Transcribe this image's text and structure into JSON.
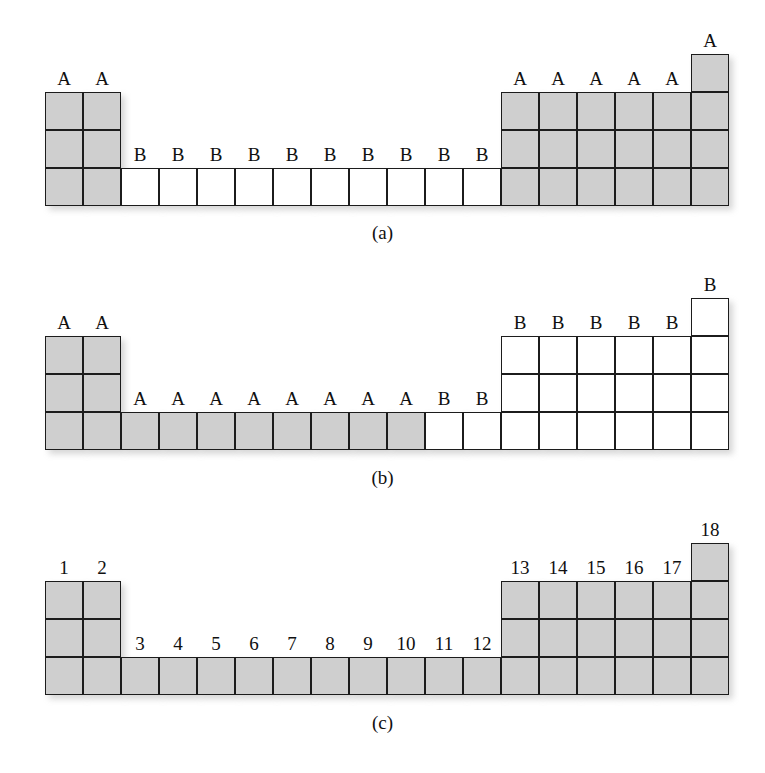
{
  "figure": {
    "colors": {
      "shaded_cell": "#cfcfcf",
      "empty_cell": "#ffffff",
      "cell_border": "#1c1c1c",
      "text": "#101010",
      "background": "#ffffff"
    },
    "geometry": {
      "columns": 18,
      "cell_size": 38,
      "grid_left": 45
    }
  },
  "panels": [
    {
      "id": "panel-a",
      "caption": "(a)",
      "caption_y": 222,
      "grid_top": 54,
      "columns": [
        {
          "index": 1,
          "label": "A",
          "shaded": true,
          "rows": 3,
          "row_offset": 1
        },
        {
          "index": 2,
          "label": "A",
          "shaded": true,
          "rows": 3,
          "row_offset": 1
        },
        {
          "index": 3,
          "label": "B",
          "shaded": false,
          "rows": 1,
          "row_offset": 3
        },
        {
          "index": 4,
          "label": "B",
          "shaded": false,
          "rows": 1,
          "row_offset": 3
        },
        {
          "index": 5,
          "label": "B",
          "shaded": false,
          "rows": 1,
          "row_offset": 3
        },
        {
          "index": 6,
          "label": "B",
          "shaded": false,
          "rows": 1,
          "row_offset": 3
        },
        {
          "index": 7,
          "label": "B",
          "shaded": false,
          "rows": 1,
          "row_offset": 3
        },
        {
          "index": 8,
          "label": "B",
          "shaded": false,
          "rows": 1,
          "row_offset": 3
        },
        {
          "index": 9,
          "label": "B",
          "shaded": false,
          "rows": 1,
          "row_offset": 3
        },
        {
          "index": 10,
          "label": "B",
          "shaded": false,
          "rows": 1,
          "row_offset": 3
        },
        {
          "index": 11,
          "label": "B",
          "shaded": false,
          "rows": 1,
          "row_offset": 3
        },
        {
          "index": 12,
          "label": "B",
          "shaded": false,
          "rows": 1,
          "row_offset": 3
        },
        {
          "index": 13,
          "label": "A",
          "shaded": true,
          "rows": 3,
          "row_offset": 1
        },
        {
          "index": 14,
          "label": "A",
          "shaded": true,
          "rows": 3,
          "row_offset": 1
        },
        {
          "index": 15,
          "label": "A",
          "shaded": true,
          "rows": 3,
          "row_offset": 1
        },
        {
          "index": 16,
          "label": "A",
          "shaded": true,
          "rows": 3,
          "row_offset": 1
        },
        {
          "index": 17,
          "label": "A",
          "shaded": true,
          "rows": 3,
          "row_offset": 1
        },
        {
          "index": 18,
          "label": "A",
          "shaded": true,
          "rows": 4,
          "row_offset": 0
        }
      ]
    },
    {
      "id": "panel-b",
      "caption": "(b)",
      "caption_y": 467,
      "grid_top": 298,
      "columns": [
        {
          "index": 1,
          "label": "A",
          "shaded": true,
          "rows": 3,
          "row_offset": 1
        },
        {
          "index": 2,
          "label": "A",
          "shaded": true,
          "rows": 3,
          "row_offset": 1
        },
        {
          "index": 3,
          "label": "A",
          "shaded": true,
          "rows": 1,
          "row_offset": 3
        },
        {
          "index": 4,
          "label": "A",
          "shaded": true,
          "rows": 1,
          "row_offset": 3
        },
        {
          "index": 5,
          "label": "A",
          "shaded": true,
          "rows": 1,
          "row_offset": 3
        },
        {
          "index": 6,
          "label": "A",
          "shaded": true,
          "rows": 1,
          "row_offset": 3
        },
        {
          "index": 7,
          "label": "A",
          "shaded": true,
          "rows": 1,
          "row_offset": 3
        },
        {
          "index": 8,
          "label": "A",
          "shaded": true,
          "rows": 1,
          "row_offset": 3
        },
        {
          "index": 9,
          "label": "A",
          "shaded": true,
          "rows": 1,
          "row_offset": 3
        },
        {
          "index": 10,
          "label": "A",
          "shaded": true,
          "rows": 1,
          "row_offset": 3
        },
        {
          "index": 11,
          "label": "B",
          "shaded": false,
          "rows": 1,
          "row_offset": 3
        },
        {
          "index": 12,
          "label": "B",
          "shaded": false,
          "rows": 1,
          "row_offset": 3
        },
        {
          "index": 13,
          "label": "B",
          "shaded": false,
          "rows": 3,
          "row_offset": 1
        },
        {
          "index": 14,
          "label": "B",
          "shaded": false,
          "rows": 3,
          "row_offset": 1
        },
        {
          "index": 15,
          "label": "B",
          "shaded": false,
          "rows": 3,
          "row_offset": 1
        },
        {
          "index": 16,
          "label": "B",
          "shaded": false,
          "rows": 3,
          "row_offset": 1
        },
        {
          "index": 17,
          "label": "B",
          "shaded": false,
          "rows": 3,
          "row_offset": 1
        },
        {
          "index": 18,
          "label": "B",
          "shaded": false,
          "rows": 4,
          "row_offset": 0
        }
      ]
    },
    {
      "id": "panel-c",
      "caption": "(c)",
      "caption_y": 712,
      "grid_top": 543,
      "columns": [
        {
          "index": 1,
          "label": "1",
          "shaded": true,
          "rows": 3,
          "row_offset": 1
        },
        {
          "index": 2,
          "label": "2",
          "shaded": true,
          "rows": 3,
          "row_offset": 1
        },
        {
          "index": 3,
          "label": "3",
          "shaded": true,
          "rows": 1,
          "row_offset": 3
        },
        {
          "index": 4,
          "label": "4",
          "shaded": true,
          "rows": 1,
          "row_offset": 3
        },
        {
          "index": 5,
          "label": "5",
          "shaded": true,
          "rows": 1,
          "row_offset": 3
        },
        {
          "index": 6,
          "label": "6",
          "shaded": true,
          "rows": 1,
          "row_offset": 3
        },
        {
          "index": 7,
          "label": "7",
          "shaded": true,
          "rows": 1,
          "row_offset": 3
        },
        {
          "index": 8,
          "label": "8",
          "shaded": true,
          "rows": 1,
          "row_offset": 3
        },
        {
          "index": 9,
          "label": "9",
          "shaded": true,
          "rows": 1,
          "row_offset": 3
        },
        {
          "index": 10,
          "label": "10",
          "shaded": true,
          "rows": 1,
          "row_offset": 3
        },
        {
          "index": 11,
          "label": "11",
          "shaded": true,
          "rows": 1,
          "row_offset": 3
        },
        {
          "index": 12,
          "label": "12",
          "shaded": true,
          "rows": 1,
          "row_offset": 3
        },
        {
          "index": 13,
          "label": "13",
          "shaded": true,
          "rows": 3,
          "row_offset": 1
        },
        {
          "index": 14,
          "label": "14",
          "shaded": true,
          "rows": 3,
          "row_offset": 1
        },
        {
          "index": 15,
          "label": "15",
          "shaded": true,
          "rows": 3,
          "row_offset": 1
        },
        {
          "index": 16,
          "label": "16",
          "shaded": true,
          "rows": 3,
          "row_offset": 1
        },
        {
          "index": 17,
          "label": "17",
          "shaded": true,
          "rows": 3,
          "row_offset": 1
        },
        {
          "index": 18,
          "label": "18",
          "shaded": true,
          "rows": 4,
          "row_offset": 0
        }
      ]
    }
  ]
}
